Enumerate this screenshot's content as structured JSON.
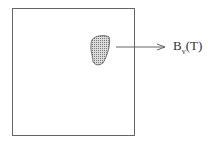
{
  "diagram": {
    "box": {
      "label": ""
    },
    "blob": {
      "fill": "hatched"
    },
    "arrow": {
      "direction": "right"
    },
    "label": {
      "main": "B",
      "subscript": "v",
      "suffix": "(T)"
    }
  }
}
